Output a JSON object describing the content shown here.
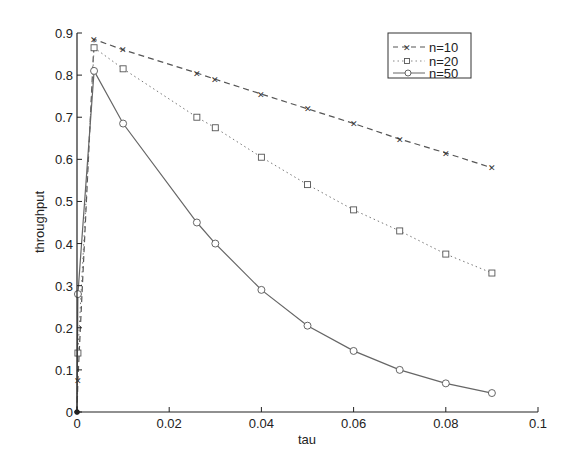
{
  "chart_data": {
    "type": "line",
    "title": "",
    "xlabel": "tau",
    "ylabel": "throughput",
    "xlim": [
      0,
      0.1
    ],
    "ylim": [
      0,
      0.9
    ],
    "grid": false,
    "legend_position": "upper right",
    "x_ticks": [
      "0",
      "0.02",
      "0.04",
      "0.06",
      "0.08",
      "0.1"
    ],
    "y_ticks": [
      "0",
      "0.1",
      "0.2",
      "0.3",
      "0.4",
      "0.5",
      "0.6",
      "0.7",
      "0.8",
      "0.9"
    ],
    "x": [
      0,
      0.0002,
      0.0037,
      0.01,
      0.026,
      0.03,
      0.04,
      0.05,
      0.06,
      0.07,
      0.08,
      0.09
    ],
    "series": [
      {
        "name": "n=10",
        "line_style": "dashed",
        "marker": "x",
        "color": "#555555",
        "values": [
          0,
          0.075,
          0.885,
          0.86,
          0.805,
          0.79,
          0.755,
          0.72,
          0.685,
          0.648,
          0.615,
          0.58
        ]
      },
      {
        "name": "n=20",
        "line_style": "dotted",
        "marker": "square",
        "color": "#777777",
        "values": [
          0,
          0.14,
          0.865,
          0.815,
          0.7,
          0.675,
          0.605,
          0.54,
          0.48,
          0.43,
          0.375,
          0.33
        ]
      },
      {
        "name": "n=50",
        "line_style": "solid",
        "marker": "circle",
        "color": "#666666",
        "values": [
          0,
          0.28,
          0.81,
          0.685,
          0.45,
          0.4,
          0.29,
          0.205,
          0.145,
          0.1,
          0.068,
          0.045
        ]
      }
    ]
  },
  "legend": {
    "items": [
      {
        "label": "n=10"
      },
      {
        "label": "n=20"
      },
      {
        "label": "n=50"
      }
    ]
  },
  "axes": {
    "xlabel": "tau",
    "ylabel": "throughput"
  }
}
